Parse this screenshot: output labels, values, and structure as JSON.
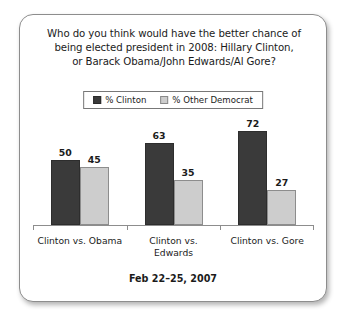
{
  "card": {
    "title_lines": [
      "Who do you think would have the better chance of",
      "being elected president in 2008: Hillary Clinton,",
      "or Barack Obama/John Edwards/Al Gore?"
    ],
    "footer_note": "Feb 22–25, 2007"
  },
  "colors": {
    "clinton_bar": "#3a3a3a",
    "other_democrat_bar": "#cdcdcd",
    "card_border": "#8d8d8d",
    "axis": "#8d8d8d",
    "text": "#1b1b1b",
    "background": "#ffffff"
  },
  "chart_data": {
    "type": "bar",
    "title": "Who do you think would have the better chance of being elected president in 2008: Hillary Clinton, or Barack Obama/John Edwards/Al Gore?",
    "subtitle": "Feb 22–25, 2007",
    "categories": [
      "Clinton vs. Obama",
      "Clinton vs. Edwards",
      "Clinton vs. Gore"
    ],
    "series": [
      {
        "name": "% Clinton",
        "values": [
          50,
          63,
          72
        ],
        "color": "#3a3a3a"
      },
      {
        "name": "% Other Democrat",
        "values": [
          45,
          35,
          27
        ],
        "color": "#cdcdcd"
      }
    ],
    "xlabel": "",
    "ylabel": "",
    "ylim": [
      0,
      80
    ],
    "grid": false,
    "legend_position": "top-center",
    "data_labels": true,
    "bars": [
      {
        "category": "Clinton vs. Obama",
        "series": "% Clinton",
        "value": 50
      },
      {
        "category": "Clinton vs. Obama",
        "series": "% Other Democrat",
        "value": 45
      },
      {
        "category": "Clinton vs. Edwards",
        "series": "% Clinton",
        "value": 63
      },
      {
        "category": "Clinton vs. Edwards",
        "series": "% Other Democrat",
        "value": 35
      },
      {
        "category": "Clinton vs. Gore",
        "series": "% Clinton",
        "value": 72
      },
      {
        "category": "Clinton vs. Gore",
        "series": "% Other Democrat",
        "value": 27
      }
    ]
  }
}
